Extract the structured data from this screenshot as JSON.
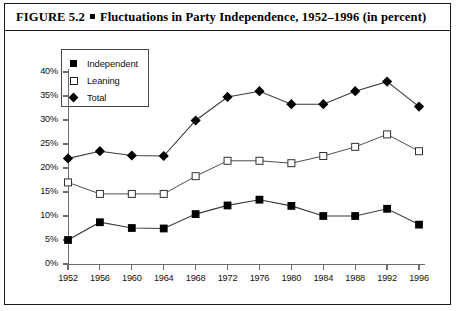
{
  "figure": {
    "label": "FIGURE 5.2",
    "bullet": "filled-square-bullet",
    "title": "Fluctuations in Party Independence, 1952–1996 (in percent)"
  },
  "legend": {
    "entries": [
      {
        "label": "Independent",
        "marker": "filled-square",
        "color": "#000000"
      },
      {
        "label": "Leaning",
        "marker": "open-square",
        "color": "#ffffff"
      },
      {
        "label": "Total",
        "marker": "filled-diamond",
        "color": "#000000"
      }
    ]
  },
  "chart_data": {
    "type": "line",
    "title": "Fluctuations in Party Independence, 1952–1996 (in percent)",
    "xlabel": "",
    "ylabel": "",
    "x": [
      1952,
      1956,
      1960,
      1964,
      1968,
      1972,
      1976,
      1980,
      1984,
      1988,
      1992,
      1996
    ],
    "categories": [
      "1952",
      "1956",
      "1960",
      "1964",
      "1968",
      "1972",
      "1976",
      "1980",
      "1984",
      "1988",
      "1992",
      "1996"
    ],
    "ylim": [
      0,
      40
    ],
    "yticks": [
      0,
      5,
      10,
      15,
      20,
      25,
      30,
      35,
      40
    ],
    "ytick_labels": [
      "0%",
      "5%",
      "10%",
      "15%",
      "20%",
      "25%",
      "30%",
      "35%",
      "40%"
    ],
    "grid": false,
    "legend_position": "upper-left-inside",
    "series": [
      {
        "name": "Independent",
        "marker": "filled-square",
        "color": "#000000",
        "values": [
          5.0,
          8.7,
          7.5,
          7.4,
          10.4,
          12.2,
          13.4,
          12.1,
          10.0,
          10.0,
          11.5,
          8.2
        ]
      },
      {
        "name": "Leaning",
        "marker": "open-square",
        "color": "#000000",
        "values": [
          17.0,
          14.6,
          14.6,
          14.6,
          18.3,
          21.5,
          21.5,
          21.0,
          22.5,
          24.4,
          27.0,
          23.5
        ]
      },
      {
        "name": "Total",
        "marker": "filled-diamond",
        "color": "#000000",
        "values": [
          22.0,
          23.5,
          22.6,
          22.5,
          29.9,
          34.8,
          36.0,
          33.3,
          33.3,
          36.0,
          38.0,
          32.8
        ]
      }
    ]
  }
}
